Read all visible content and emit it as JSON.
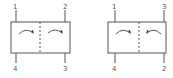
{
  "diagrams": [
    {
      "name": "valve-symbol-left",
      "ports": {
        "top_left": "1",
        "top_right": "2",
        "bottom_left": "4",
        "bottom_right": "3"
      }
    },
    {
      "name": "valve-symbol-right",
      "ports": {
        "top_left": "1",
        "top_right": "3",
        "bottom_left": "4",
        "bottom_right": "2"
      }
    }
  ],
  "colors": {
    "stroke": "#555555",
    "background": "#ffffff"
  }
}
